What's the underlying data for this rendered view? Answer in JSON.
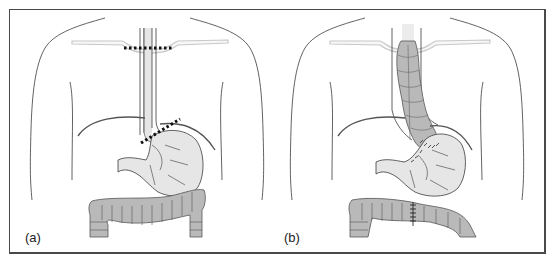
{
  "figure": {
    "panels": [
      {
        "id": "a",
        "label": "(a)",
        "description": "Torso with esophagus, stomach and colon; dotted resection lines at neck and gastro-esophageal junction"
      },
      {
        "id": "b",
        "label": "(b)",
        "description": "Colon segment interposed in place of esophagus, anastomosed to stomach; colon re-joined with sutures"
      }
    ],
    "colors": {
      "outline": "#3a3a3a",
      "organ_fill": "#e6e6e6",
      "colon_fill": "#b9b9b9",
      "clavicle": "#c8c8c8",
      "frame": "#4a4a4a",
      "cut_line": "#111111"
    }
  }
}
